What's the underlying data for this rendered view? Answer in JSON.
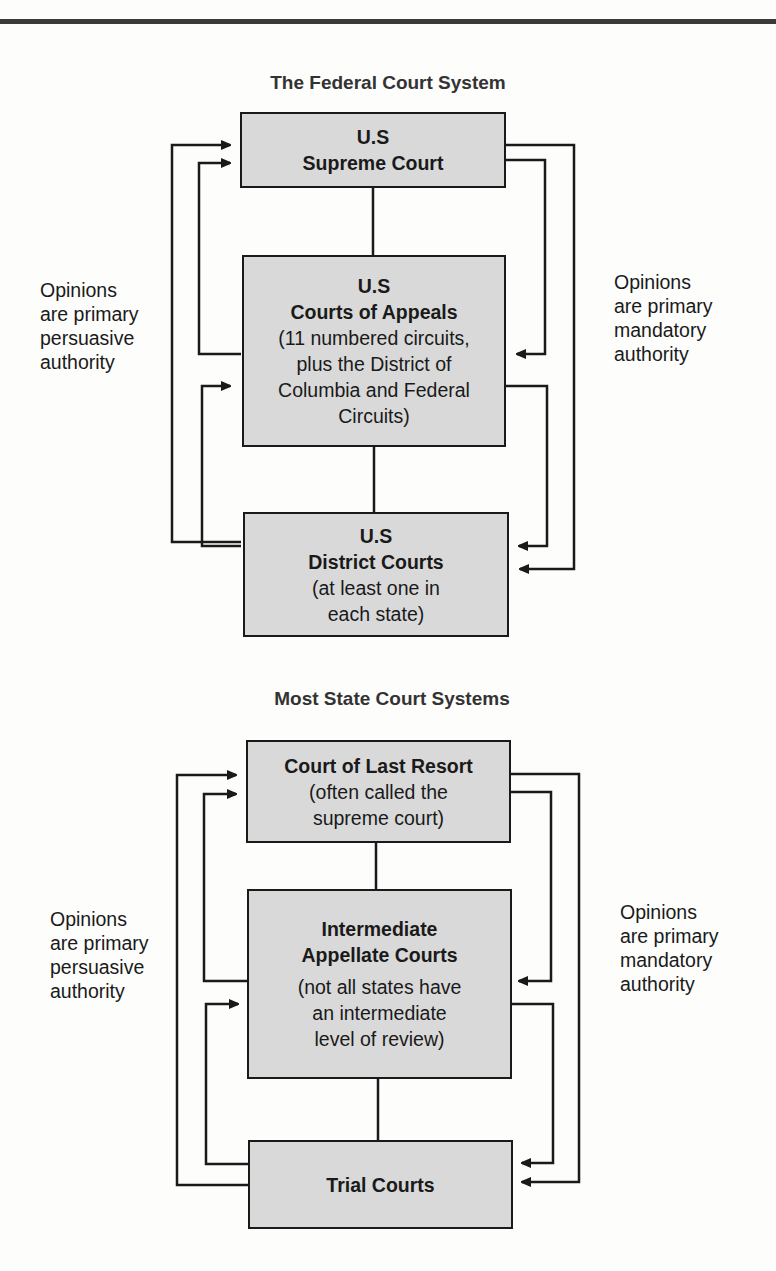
{
  "header": {
    "rule": "top-border"
  },
  "federal": {
    "title": "The Federal Court System",
    "supreme": {
      "line1": "U.S",
      "line2": "Supreme Court"
    },
    "appeals": {
      "line1": "U.S",
      "line2": "Courts of Appeals",
      "line3": "(11 numbered circuits,",
      "line4": "plus the District of",
      "line5": "Columbia and Federal",
      "line6": "Circuits)"
    },
    "district": {
      "line1": "U.S",
      "line2": "District Courts",
      "line3": "(at least one in",
      "line4": "each state)"
    },
    "left_label": {
      "line1": "Opinions",
      "line2": "are primary",
      "line3": "persuasive",
      "line4": "authority"
    },
    "right_label": {
      "line1": "Opinions",
      "line2": "are primary",
      "line3": "mandatory",
      "line4": "authority"
    }
  },
  "state": {
    "title": "Most State Court Systems",
    "last_resort": {
      "line1": "Court of Last Resort",
      "line2": "(often called the",
      "line3": "supreme court)"
    },
    "intermediate": {
      "line1": "Intermediate",
      "line2": "Appellate Courts",
      "line3": "(not all states have",
      "line4": "an intermediate",
      "line5": "level of review)"
    },
    "trial": {
      "line1": "Trial Courts"
    },
    "left_label": {
      "line1": "Opinions",
      "line2": "are primary",
      "line3": "persuasive",
      "line4": "authority"
    },
    "right_label": {
      "line1": "Opinions",
      "line2": "are primary",
      "line3": "mandatory",
      "line4": "authority"
    }
  },
  "colors": {
    "box_fill": "#d9d9d9",
    "line": "#1a1a1a",
    "background": "#fdfdfb"
  }
}
